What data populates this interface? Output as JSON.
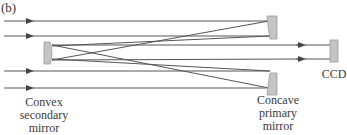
{
  "panel_label": "(b)",
  "labels": {
    "secondary": [
      "Convex",
      "secondary",
      "mirror"
    ],
    "primary": [
      "Concave",
      "primary",
      "mirror"
    ],
    "ccd": "CCD"
  },
  "colors": {
    "ray": "#555555",
    "mirror_fill": "#c4c4c4",
    "mirror_stroke": "#9a9a9a"
  }
}
